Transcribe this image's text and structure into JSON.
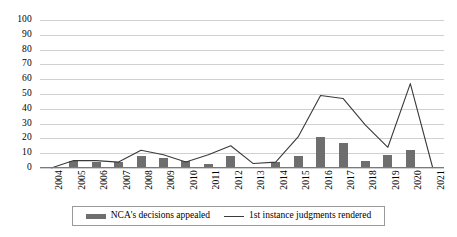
{
  "chart_data": {
    "type": "bar",
    "title": "",
    "subtitle": "",
    "xlabel": "",
    "ylabel": "",
    "categories": [
      "2004",
      "2005",
      "2006",
      "2007",
      "2008",
      "2009",
      "2010",
      "2011",
      "2012",
      "2013",
      "2014",
      "2015",
      "2016",
      "2017",
      "2018",
      "2019",
      "2020",
      "2021"
    ],
    "ylim": [
      0,
      100
    ],
    "y_ticks": [
      0,
      10,
      20,
      30,
      40,
      50,
      60,
      70,
      80,
      90,
      100
    ],
    "grid": true,
    "legend_position": "bottom",
    "series": [
      {
        "name": "NCA's decisions appealed",
        "type": "bar",
        "color": "#6e6e6e",
        "values": [
          0,
          5,
          4,
          4,
          8,
          7,
          5,
          3,
          8,
          1,
          4,
          8,
          21,
          17,
          5,
          9,
          12,
          0
        ]
      },
      {
        "name": "1st instance judgments rendered",
        "type": "line",
        "color": "#3a3a3a",
        "values": [
          0,
          5,
          5,
          4,
          12,
          9,
          4,
          9,
          15,
          3,
          4,
          21,
          49,
          47,
          29,
          14,
          57,
          0
        ]
      }
    ]
  },
  "legend": {
    "bar_label": "NCA's decisions appealed",
    "line_label": "1st instance judgments rendered"
  }
}
